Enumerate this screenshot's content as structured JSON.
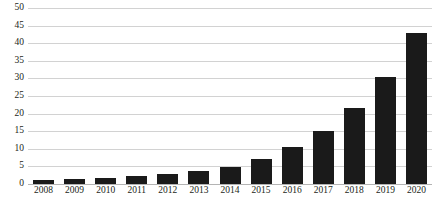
{
  "chart_data": {
    "type": "bar",
    "title": "",
    "xlabel": "",
    "ylabel": "",
    "ylim": [
      0,
      50
    ],
    "ytick_step": 5,
    "grid": true,
    "legend": "none",
    "bar_color": "#1a1a1a",
    "gridline_color": "#d2d2d2",
    "categories": [
      "2008",
      "2009",
      "2010",
      "2011",
      "2012",
      "2013",
      "2014",
      "2015",
      "2016",
      "2017",
      "2018",
      "2019",
      "2020"
    ],
    "values": [
      1,
      1.4,
      1.8,
      2.3,
      2.8,
      3.8,
      4.8,
      7,
      10.5,
      15,
      21.5,
      30.5,
      43
    ],
    "yticks": [
      "0",
      "5",
      "10",
      "15",
      "20",
      "25",
      "30",
      "35",
      "40",
      "45",
      "50"
    ]
  },
  "caption": {
    "text": ""
  }
}
